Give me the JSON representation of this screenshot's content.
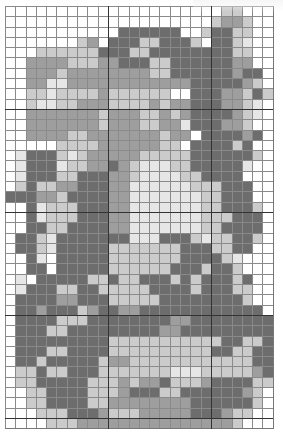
{
  "chart": {
    "title": "",
    "columns": 26,
    "rows": 41,
    "palette": {
      "0": "#ffffff",
      "1": "#e6e6e6",
      "2": "#cbcbcb",
      "3": "#9e9e9e",
      "4": "#6d6d6d"
    },
    "grid": [
      "0000000000000000000002200",
      "00000000000000000000233200",
      "00000000000444444002442200",
      "00000002304442244420442100",
      "00022222244422444444442200",
      "00333322233444224444443300",
      "00333233333333224444443440",
      "00331133333333333344444320",
      "00221222232222220044433242",
      "00211223332222323344433210",
      "00333333323332232344443210",
      "00333333323332233144433200",
      "00333322333333323304444340",
      "00000222233333322044442400",
      "01444212333332222244444420",
      "01444122334321112244444100",
      "01444224443321111224444000",
      "02422334443311111122244400",
      "44433244443311111112244400",
      "00412224443311111112244420",
      "00412224443311111112224440",
      "00442244443311111112244440",
      "04421444444411144421224420",
      "04421444442222222444224400",
      "00410444442222222444421000",
      "00440444442222224442442000",
      "01044444224224442424442400",
      "01444224422222444424442200",
      "04444334442222244444444200",
      "04434442344334444444444440",
      "04444222444444443344444444",
      "04442244444444433444444444",
      "04444444442222222222244224",
      "04442244442222222222442244",
      "04424444423322222222222244",
      "02242244422222221112222234",
      "02244444222323342223444422",
      "00224444222344422444444320",
      "00224444223333333344444420",
      "00022244432223333344432200",
      "00002223333333333333332000"
    ],
    "major_lines": {
      "every": 10
    }
  }
}
